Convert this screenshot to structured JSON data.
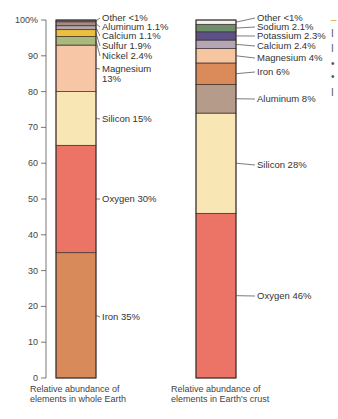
{
  "chart_data": [
    {
      "type": "bar",
      "subtype": "stacked-single-column",
      "title": "Relative abundance of elements in whole Earth",
      "ylabel": "",
      "ylim": [
        0,
        100
      ],
      "yticks": [
        "0",
        "10",
        "20",
        "30",
        "40",
        "50",
        "60",
        "70",
        "80",
        "90",
        "100%"
      ],
      "segments": [
        {
          "name": "Iron",
          "value": 35,
          "label": "Iron 35%",
          "color": "#d98a5a"
        },
        {
          "name": "Oxygen",
          "value": 30,
          "label": "Oxygen 30%",
          "color": "#ec7466"
        },
        {
          "name": "Silicon",
          "value": 15,
          "label": "Silicon 15%",
          "color": "#f8e6b4"
        },
        {
          "name": "Magnesium",
          "value": 13,
          "label": "Magnesium 13%",
          "color": "#f6c6a6"
        },
        {
          "name": "Nickel",
          "value": 2.4,
          "label": "Nickel 2.4%",
          "color": "#a9b97e"
        },
        {
          "name": "Sulfur",
          "value": 1.9,
          "label": "Sulfur 1.9%",
          "color": "#e9c13e"
        },
        {
          "name": "Calcium",
          "value": 1.1,
          "label": "Calcium 1.1%",
          "color": "#b3a4ae"
        },
        {
          "name": "Aluminum",
          "value": 1.1,
          "label": "Aluminum 1.1%",
          "color": "#a48c82"
        },
        {
          "name": "Other",
          "value": 0.5,
          "label": "Other <1%",
          "color": "#7a6f86"
        }
      ]
    },
    {
      "type": "bar",
      "subtype": "stacked-single-column",
      "title": "Relative abundance of elements in Earth's crust",
      "ylim": [
        0,
        100
      ],
      "segments": [
        {
          "name": "Oxygen",
          "value": 46,
          "label": "Oxygen 46%",
          "color": "#ec7466"
        },
        {
          "name": "Silicon",
          "value": 28,
          "label": "Silicon 28%",
          "color": "#f8e6b4"
        },
        {
          "name": "Aluminum",
          "value": 8,
          "label": "Aluminum 8%",
          "color": "#b59c8a"
        },
        {
          "name": "Iron",
          "value": 6,
          "label": "Iron 6%",
          "color": "#db8a5a"
        },
        {
          "name": "Magnesium",
          "value": 4,
          "label": "Magnesium 4%",
          "color": "#f6c6a0"
        },
        {
          "name": "Calcium",
          "value": 2.4,
          "label": "Calcium 2.4%",
          "color": "#b5a6b6"
        },
        {
          "name": "Potassium",
          "value": 2.3,
          "label": "Potassium 2.3%",
          "color": "#5c5088"
        },
        {
          "name": "Sodium",
          "value": 2.1,
          "label": "Sodium 2.1%",
          "color": "#6f8f6a"
        },
        {
          "name": "Other",
          "value": 1.2,
          "label": "Other <1%",
          "color": "#eef3f2"
        }
      ]
    }
  ],
  "captions": {
    "left_line1": "Relative abundance of",
    "left_line2": "elements in whole Earth",
    "right_line1": "Relative abundance of",
    "right_line2": "elements in Earth's crust"
  },
  "cutoff_text": [
    "‒",
    "I",
    "I",
    "•",
    "•",
    "I"
  ]
}
